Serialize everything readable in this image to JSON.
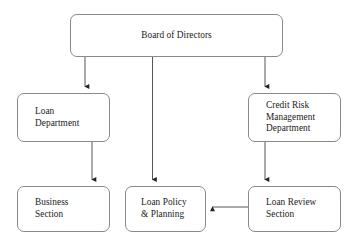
{
  "diagram": {
    "type": "org-chart",
    "colors": {
      "background": "#ffffff",
      "node_border": "#8a8a8a",
      "node_fill": "#ffffff",
      "edge": "#555555",
      "text": "#1a1a1a"
    },
    "nodes": [
      {
        "id": "board",
        "label": "Board of Directors",
        "level": 1,
        "text_align": "center"
      },
      {
        "id": "loan_department",
        "label": "Loan\nDepartment",
        "level": 2,
        "text_align": "left"
      },
      {
        "id": "credit_risk_management_department",
        "label": "Credit Risk\nManagement\nDepartment",
        "level": 2,
        "text_align": "left"
      },
      {
        "id": "business_section",
        "label": "Business\nSection",
        "level": 3,
        "text_align": "left"
      },
      {
        "id": "loan_policy_planning",
        "label": "Loan Policy\n& Planning",
        "level": 3,
        "text_align": "left"
      },
      {
        "id": "loan_review_section",
        "label": "Loan Review\nSection",
        "level": 3,
        "text_align": "left"
      }
    ],
    "edges": [
      {
        "id": "board-to-loan-department",
        "from": "board",
        "to": "loan_department",
        "arrow": "down"
      },
      {
        "id": "board-to-loan-policy",
        "from": "board",
        "to": "loan_policy_planning",
        "arrow": "down"
      },
      {
        "id": "board-to-credit-risk",
        "from": "board",
        "to": "credit_risk_management_department",
        "arrow": "down"
      },
      {
        "id": "loan-department-to-business",
        "from": "loan_department",
        "to": "business_section",
        "arrow": "down"
      },
      {
        "id": "credit-risk-to-loan-review",
        "from": "credit_risk_management_department",
        "to": "loan_review_section",
        "arrow": "down"
      },
      {
        "id": "loan-review-to-loan-policy",
        "from": "loan_review_section",
        "to": "loan_policy_planning",
        "arrow": "left"
      }
    ]
  }
}
